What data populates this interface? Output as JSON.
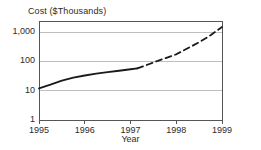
{
  "chart_data": {
    "type": "line",
    "title": "Cost ($Thousands)",
    "xlabel": "Year",
    "ylabel": "Cost ($Thousands)",
    "yscale": "log",
    "ylim": [
      1,
      3000
    ],
    "xlim": [
      1995,
      1999
    ],
    "ytick_labels": [
      "1",
      "10",
      "100",
      "1,000"
    ],
    "ytick_values": [
      1,
      10,
      100,
      1000
    ],
    "xtick_labels": [
      "1995",
      "1996",
      "1997",
      "1998",
      "1999"
    ],
    "xtick_values": [
      1995,
      1996,
      1997,
      1998,
      1999
    ],
    "grid": true,
    "legend": "none",
    "series": [
      {
        "name": "Actual",
        "style": "solid",
        "color": "#1a1a1a",
        "x": [
          1995.0,
          1995.25,
          1995.5,
          1995.75,
          1996.0,
          1996.25,
          1996.5,
          1996.75,
          1997.0,
          1997.15
        ],
        "values": [
          12,
          16,
          22,
          28,
          33,
          38,
          43,
          48,
          54,
          58
        ]
      },
      {
        "name": "Projected",
        "style": "dashed",
        "color": "#1a1a1a",
        "x": [
          1997.15,
          1997.4,
          1997.6,
          1997.8,
          1998.0,
          1998.25,
          1998.5,
          1998.75,
          1999.0
        ],
        "values": [
          58,
          80,
          105,
          135,
          175,
          280,
          450,
          780,
          1500
        ]
      }
    ]
  },
  "axis_labels": {
    "y": [
      {
        "text": "1,000",
        "value": 1000
      },
      {
        "text": "100",
        "value": 100
      },
      {
        "text": "10",
        "value": 10
      },
      {
        "text": "1",
        "value": 1
      }
    ],
    "x": [
      {
        "text": "1995",
        "value": 1995
      },
      {
        "text": "1996",
        "value": 1996
      },
      {
        "text": "1997",
        "value": 1997
      },
      {
        "text": "1998",
        "value": 1998
      },
      {
        "text": "1999",
        "value": 1999
      }
    ]
  },
  "style": {
    "axis_color": "#555555",
    "grid_color": "#bfbfbf",
    "line_color": "#1a1a1a",
    "text_color": "#2b2b2b",
    "background": "#ffffff"
  },
  "plot_geometry": {
    "left": 39,
    "right": 222,
    "top": 21,
    "bottom": 120,
    "decade_px": 29.3
  }
}
